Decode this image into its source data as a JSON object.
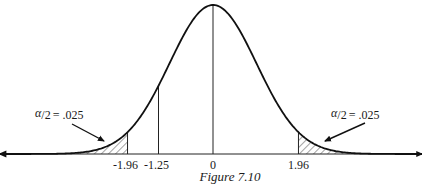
{
  "chart_data": {
    "type": "area",
    "title": "",
    "caption": "Figure 7.10",
    "distribution": "standard normal",
    "xlabel": "",
    "ylabel": "",
    "xlim": [
      -4.9,
      4.8
    ],
    "grid": false,
    "tick_values": [
      -1.96,
      -1.25,
      0,
      1.96
    ],
    "tick_labels": [
      "-1.96",
      "-1.25",
      "0",
      "1.96"
    ],
    "vertical_lines_at": [
      -1.96,
      -1.25,
      0,
      1.96
    ],
    "shaded_regions": [
      {
        "name": "left-tail",
        "from": "-inf",
        "to": -1.96,
        "hatch": "diagonal"
      },
      {
        "name": "right-tail",
        "from": 1.96,
        "to": "inf",
        "hatch": "diagonal"
      }
    ],
    "annotations": [
      {
        "name": "left-tail-annotation",
        "alpha_symbol": "α",
        "fraction_tail": "/2",
        "equals": "= .025",
        "text": "α/2 = .025",
        "tail": "left"
      },
      {
        "name": "right-tail-annotation",
        "alpha_symbol": "α",
        "fraction_tail": "/2",
        "equals": "= .025",
        "text": "α/2 = .025",
        "tail": "right"
      }
    ],
    "tail_area_each": 0.025
  }
}
